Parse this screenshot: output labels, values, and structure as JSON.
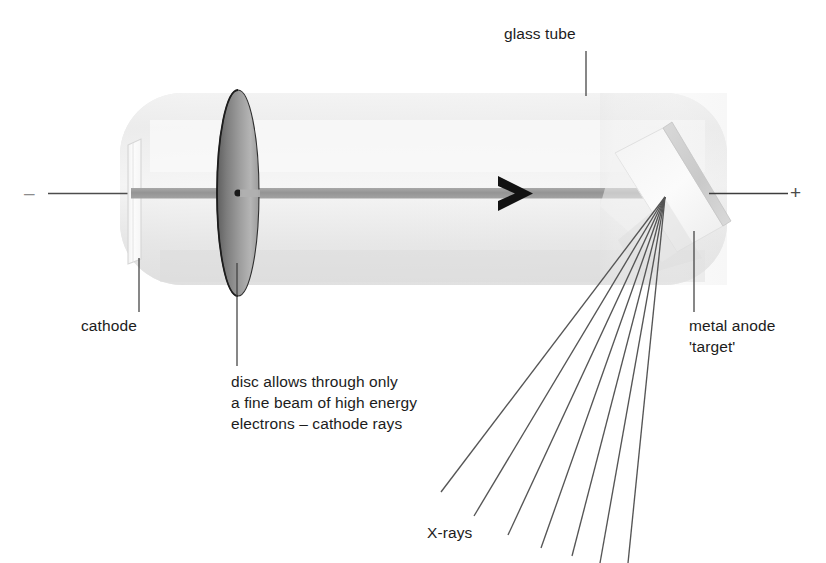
{
  "figure": {
    "background_color": "#ffffff"
  },
  "labels": {
    "glass_tube": "glass tube",
    "cathode": "cathode",
    "disc_note": "disc allows through only\na fine beam of high energy\nelectrons – cathode rays",
    "metal_anode": "metal anode\n'target'",
    "xrays": "X-rays"
  },
  "terminals": {
    "negative_sign": "–",
    "positive_sign": "+"
  },
  "colors": {
    "text": "#1c1c1c",
    "tube_fill": "#e9e9e9",
    "tube_fill_light": "#f2f2f2",
    "disc_dark": "#666666",
    "disc_light": "#b9b9b9",
    "beam": "#9a9a9a",
    "arrow": "#111111",
    "anode_face": "#efefef",
    "anode_edge": "#cfcfcf",
    "ray_line": "#555555",
    "leader_line": "#4a4a4a",
    "cathode_plate": "#fdfdfd",
    "cathode_outline": "#d8d8d8"
  },
  "geometry": {
    "tube": {
      "x": 120,
      "y": 93,
      "width": 607,
      "height": 192,
      "radius": 60
    },
    "beam_axis_y": 193,
    "cathode_plate": {
      "x": 128,
      "y": 141,
      "width": 13,
      "height": 120
    },
    "disc": {
      "cx": 238,
      "cy": 193,
      "rx": 21,
      "ry": 103
    },
    "disc_hole": {
      "cx": 238,
      "cy": 193,
      "r": 3.5
    },
    "arrow_x": 515,
    "anode_focus": {
      "x": 665,
      "y": 197
    },
    "ray_count": 7
  }
}
